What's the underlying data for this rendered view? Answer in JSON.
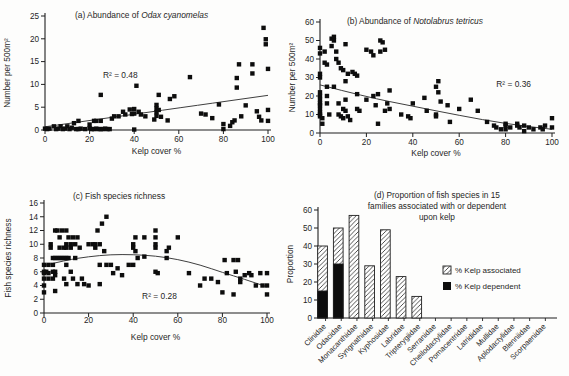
{
  "figure": {
    "background": "#fdfdfc",
    "ink": "#1f1f1f",
    "marker_color": "#0d0d0d",
    "trend_color": "#3f3f3f"
  },
  "chart_data": [
    {
      "id": "a",
      "type": "scatter",
      "title_parts": [
        {
          "t": "(a)  Abundance of ",
          "i": false
        },
        {
          "t": "Odax cyanomelas",
          "i": true
        }
      ],
      "xlabel": "Kelp cover %",
      "ylabel": "Number per 500m²",
      "xlim": [
        0,
        100
      ],
      "ylim": [
        0,
        25
      ],
      "xticks": [
        0,
        20,
        40,
        60,
        80,
        100
      ],
      "yticks": [
        0,
        5,
        10,
        15,
        20,
        25
      ],
      "annotation": {
        "text": "R² = 0.48",
        "x": 26,
        "y": 11.5
      },
      "trend_curve": [
        [
          0,
          0.7
        ],
        [
          50,
          4.15
        ],
        [
          100,
          7.6
        ]
      ],
      "points": [
        [
          0,
          0.3
        ],
        [
          1,
          0.2
        ],
        [
          2,
          0.3
        ],
        [
          4,
          0.8
        ],
        [
          5,
          0.2
        ],
        [
          6,
          0.3
        ],
        [
          7,
          0.8
        ],
        [
          8,
          0.2
        ],
        [
          9,
          0.3
        ],
        [
          10,
          0.8
        ],
        [
          11,
          0.2
        ],
        [
          12,
          0.5
        ],
        [
          13,
          1.5
        ],
        [
          14,
          0.2
        ],
        [
          15,
          2
        ],
        [
          15,
          0.2
        ],
        [
          16,
          0.3
        ],
        [
          18,
          0.2
        ],
        [
          20,
          1.2
        ],
        [
          20,
          0.4
        ],
        [
          21,
          0.2
        ],
        [
          22,
          2
        ],
        [
          22,
          0.2
        ],
        [
          23,
          2
        ],
        [
          23,
          0.3
        ],
        [
          24,
          0.2
        ],
        [
          25,
          7.7
        ],
        [
          25,
          2
        ],
        [
          25,
          0.2
        ],
        [
          26,
          0.2
        ],
        [
          27,
          0.3
        ],
        [
          28,
          0.2
        ],
        [
          29,
          0.2
        ],
        [
          30,
          2.5
        ],
        [
          31,
          3
        ],
        [
          33,
          3
        ],
        [
          35,
          4
        ],
        [
          36,
          3.4
        ],
        [
          38,
          4.5
        ],
        [
          39,
          3.5
        ],
        [
          40,
          4.6
        ],
        [
          40,
          3.6
        ],
        [
          40,
          0.1
        ],
        [
          41,
          9.7
        ],
        [
          42,
          4
        ],
        [
          43,
          3.4
        ],
        [
          45,
          3
        ],
        [
          49,
          2.3
        ],
        [
          50,
          5.5
        ],
        [
          50,
          4.7
        ],
        [
          50,
          3.9
        ],
        [
          50,
          3.1
        ],
        [
          51,
          7.7
        ],
        [
          51,
          4.4
        ],
        [
          52,
          2.9
        ],
        [
          55,
          2.1
        ],
        [
          56,
          6.8
        ],
        [
          58,
          7.4
        ],
        [
          65,
          11.6
        ],
        [
          70,
          3.6
        ],
        [
          72,
          3.4
        ],
        [
          75,
          2.6
        ],
        [
          78,
          5.6
        ],
        [
          80,
          0.2
        ],
        [
          80,
          1.3
        ],
        [
          83,
          0.9
        ],
        [
          84,
          1.7
        ],
        [
          85,
          2.1
        ],
        [
          86,
          11.4
        ],
        [
          86,
          9.3
        ],
        [
          87,
          14.4
        ],
        [
          88,
          3
        ],
        [
          90,
          5.4
        ],
        [
          93,
          14.4
        ],
        [
          93,
          12.4
        ],
        [
          95,
          4.1
        ],
        [
          96,
          2.9
        ],
        [
          97,
          2.1
        ],
        [
          98,
          22.4
        ],
        [
          99,
          19.9
        ],
        [
          99,
          18.8
        ],
        [
          100,
          13.4
        ],
        [
          100,
          4.4
        ],
        [
          100,
          2
        ]
      ]
    },
    {
      "id": "b",
      "type": "scatter",
      "title_parts": [
        {
          "t": "(b)  Abundance of ",
          "i": false
        },
        {
          "t": "Notolabrus tetricus",
          "i": true
        }
      ],
      "xlabel": "Kelp cover %",
      "ylabel": "Number per 500m²",
      "xlim": [
        0,
        100
      ],
      "ylim": [
        0,
        60
      ],
      "xticks": [
        0,
        20,
        40,
        60,
        80,
        100
      ],
      "yticks": [
        0,
        10,
        20,
        30,
        40,
        50,
        60
      ],
      "annotation": {
        "text": "R² = 0.36",
        "x": 76,
        "y": 25
      },
      "trend_curve": [
        [
          0,
          26
        ],
        [
          20,
          19.5
        ],
        [
          40,
          14.5
        ],
        [
          60,
          9.5
        ],
        [
          80,
          5
        ],
        [
          100,
          2
        ]
      ],
      "points": [
        [
          0,
          46
        ],
        [
          0,
          43
        ],
        [
          0,
          32
        ],
        [
          0,
          30
        ],
        [
          0,
          22
        ],
        [
          0,
          20
        ],
        [
          0,
          18
        ],
        [
          0,
          16
        ],
        [
          0,
          15
        ],
        [
          0,
          13
        ],
        [
          0,
          11
        ],
        [
          0,
          10
        ],
        [
          0,
          9
        ],
        [
          1,
          8
        ],
        [
          1,
          5
        ],
        [
          2,
          44
        ],
        [
          2,
          38
        ],
        [
          3,
          37
        ],
        [
          3,
          25
        ],
        [
          3,
          20
        ],
        [
          3,
          16
        ],
        [
          4,
          10
        ],
        [
          5,
          51
        ],
        [
          5,
          47
        ],
        [
          6,
          52
        ],
        [
          6,
          50
        ],
        [
          6,
          25
        ],
        [
          7,
          44
        ],
        [
          7,
          40
        ],
        [
          8,
          38
        ],
        [
          8,
          16
        ],
        [
          8,
          10
        ],
        [
          9,
          35
        ],
        [
          9,
          9
        ],
        [
          10,
          34
        ],
        [
          10,
          13
        ],
        [
          10,
          8
        ],
        [
          11,
          48
        ],
        [
          11,
          28
        ],
        [
          11,
          18
        ],
        [
          11,
          12
        ],
        [
          12,
          32
        ],
        [
          12,
          9
        ],
        [
          13,
          7
        ],
        [
          14,
          33
        ],
        [
          15,
          32
        ],
        [
          16,
          31
        ],
        [
          16,
          21
        ],
        [
          16,
          13
        ],
        [
          17,
          12
        ],
        [
          20,
          45
        ],
        [
          20,
          18
        ],
        [
          22,
          44
        ],
        [
          23,
          42
        ],
        [
          23,
          20
        ],
        [
          24,
          15
        ],
        [
          25,
          21
        ],
        [
          25,
          5
        ],
        [
          26,
          50
        ],
        [
          26,
          44
        ],
        [
          27,
          49
        ],
        [
          28,
          45
        ],
        [
          28,
          12
        ],
        [
          29,
          16
        ],
        [
          30,
          23
        ],
        [
          30,
          13
        ],
        [
          35,
          10
        ],
        [
          38,
          9
        ],
        [
          39,
          8
        ],
        [
          40,
          16
        ],
        [
          45,
          19
        ],
        [
          46,
          12
        ],
        [
          50,
          25
        ],
        [
          50,
          10
        ],
        [
          50,
          9
        ],
        [
          51,
          28
        ],
        [
          51,
          22
        ],
        [
          52,
          17
        ],
        [
          55,
          15
        ],
        [
          56,
          6
        ],
        [
          60,
          13
        ],
        [
          65,
          18
        ],
        [
          68,
          12
        ],
        [
          72,
          6
        ],
        [
          75,
          4
        ],
        [
          76,
          3
        ],
        [
          78,
          2
        ],
        [
          80,
          5
        ],
        [
          80,
          4
        ],
        [
          80,
          2
        ],
        [
          82,
          3
        ],
        [
          85,
          5
        ],
        [
          85,
          4
        ],
        [
          86,
          3
        ],
        [
          88,
          4
        ],
        [
          88,
          1
        ],
        [
          90,
          3
        ],
        [
          92,
          2
        ],
        [
          95,
          3
        ],
        [
          96,
          2
        ],
        [
          97,
          4
        ],
        [
          100,
          8
        ],
        [
          100,
          3
        ]
      ]
    },
    {
      "id": "c",
      "type": "scatter",
      "title_parts": [
        {
          "t": "(c)  Fish species richness",
          "i": false
        }
      ],
      "xlabel": "Kelp cover %",
      "ylabel": "Fish species richness",
      "xlim": [
        0,
        100
      ],
      "ylim": [
        0,
        16
      ],
      "xticks": [
        0,
        20,
        40,
        60,
        80,
        100
      ],
      "yticks": [
        0,
        2,
        4,
        6,
        8,
        10,
        12,
        14,
        16
      ],
      "annotation": {
        "text": "R² = 0.28",
        "x": 44,
        "y": 2.1
      },
      "trend_curve": [
        [
          0,
          6.9
        ],
        [
          10,
          7.7
        ],
        [
          20,
          8.2
        ],
        [
          30,
          8.5
        ],
        [
          40,
          8.5
        ],
        [
          50,
          8.3
        ],
        [
          60,
          7.8
        ],
        [
          70,
          7.0
        ],
        [
          80,
          5.9
        ],
        [
          90,
          4.9
        ],
        [
          100,
          3.8
        ]
      ],
      "points": [
        [
          0,
          7
        ],
        [
          0,
          6
        ],
        [
          0,
          5.8
        ],
        [
          0,
          5
        ],
        [
          0,
          4
        ],
        [
          0,
          3
        ],
        [
          1,
          6
        ],
        [
          2,
          7
        ],
        [
          2,
          5.8
        ],
        [
          2,
          5
        ],
        [
          3,
          10
        ],
        [
          3,
          9.5
        ],
        [
          4,
          8
        ],
        [
          4,
          7
        ],
        [
          4,
          6
        ],
        [
          4,
          5
        ],
        [
          5,
          12
        ],
        [
          5,
          8
        ],
        [
          5,
          6
        ],
        [
          5,
          5.5
        ],
        [
          5,
          3.2
        ],
        [
          6,
          12
        ],
        [
          6,
          8
        ],
        [
          7,
          11
        ],
        [
          7,
          9.5
        ],
        [
          7,
          8
        ],
        [
          8,
          12
        ],
        [
          8,
          8
        ],
        [
          9,
          9.5
        ],
        [
          9,
          8
        ],
        [
          9,
          5
        ],
        [
          10,
          12
        ],
        [
          10,
          10
        ],
        [
          10,
          9.5
        ],
        [
          10,
          8
        ],
        [
          10,
          7
        ],
        [
          10,
          4.2
        ],
        [
          11,
          11
        ],
        [
          11,
          8
        ],
        [
          12,
          10
        ],
        [
          12,
          9.5
        ],
        [
          12,
          6
        ],
        [
          13,
          11
        ],
        [
          13,
          5
        ],
        [
          14,
          10
        ],
        [
          14,
          8
        ],
        [
          15,
          11
        ],
        [
          15,
          4.2
        ],
        [
          16,
          9.5
        ],
        [
          17,
          5
        ],
        [
          18,
          4.2
        ],
        [
          20,
          10
        ],
        [
          20,
          4
        ],
        [
          22,
          10
        ],
        [
          23,
          10
        ],
        [
          23,
          9.5
        ],
        [
          24,
          12
        ],
        [
          25,
          10
        ],
        [
          25,
          7
        ],
        [
          25,
          4.2
        ],
        [
          26,
          13
        ],
        [
          27,
          9
        ],
        [
          28,
          14
        ],
        [
          28,
          7
        ],
        [
          30,
          7
        ],
        [
          31,
          5.8
        ],
        [
          33,
          6.5
        ],
        [
          35,
          5.5
        ],
        [
          38,
          7
        ],
        [
          40,
          10
        ],
        [
          40,
          9.5
        ],
        [
          40,
          7
        ],
        [
          41,
          11
        ],
        [
          41,
          9
        ],
        [
          42,
          8
        ],
        [
          45,
          11
        ],
        [
          45,
          8.2
        ],
        [
          50,
          12
        ],
        [
          50,
          11
        ],
        [
          50,
          10
        ],
        [
          50,
          9.5
        ],
        [
          50,
          6
        ],
        [
          51,
          5.8
        ],
        [
          55,
          9
        ],
        [
          55,
          8
        ],
        [
          56,
          9.5
        ],
        [
          60,
          11
        ],
        [
          65,
          5.8
        ],
        [
          70,
          4
        ],
        [
          72,
          5
        ],
        [
          75,
          5
        ],
        [
          78,
          4.5
        ],
        [
          80,
          3
        ],
        [
          81,
          7.7
        ],
        [
          82,
          5.8
        ],
        [
          85,
          7.7
        ],
        [
          85,
          2.7
        ],
        [
          86,
          6
        ],
        [
          87,
          7.7
        ],
        [
          88,
          5
        ],
        [
          88,
          4.5
        ],
        [
          90,
          5.5
        ],
        [
          92,
          5.8
        ],
        [
          93,
          5.5
        ],
        [
          95,
          4
        ],
        [
          97,
          5.8
        ],
        [
          98,
          4
        ],
        [
          100,
          5.8
        ],
        [
          100,
          4
        ],
        [
          100,
          2.7
        ]
      ]
    },
    {
      "id": "d",
      "type": "bar",
      "title_lines": [
        "(d) Proportion of fish species in 15",
        "families associated with or dependent",
        "upon kelp"
      ],
      "ylabel": "Proportion",
      "ylim": [
        0,
        60
      ],
      "yticks": [
        0,
        10,
        20,
        30,
        40,
        50,
        60
      ],
      "categories": [
        "Clinidae",
        "Odacidae",
        "Monacanthidae",
        "Syngnathidae",
        "Kyphosidae",
        "Labridae",
        "Tripterygiidae",
        "Serranidae",
        "Cheilodactylidae",
        "Pomacentridae",
        "Latrididae",
        "Mullidae",
        "Aplodactylidae",
        "Blenniidae",
        "Scorpaenidae"
      ],
      "series": [
        {
          "name": "% Kelp associated",
          "style": "hatched",
          "values": [
            40,
            50,
            57,
            29,
            49,
            23,
            12,
            0,
            0,
            0,
            0,
            0,
            0,
            0,
            0
          ]
        },
        {
          "name": "% Kelp dependent",
          "style": "solid",
          "values": [
            15,
            30,
            0,
            0,
            0,
            0,
            0,
            0,
            0,
            0,
            0,
            0,
            0,
            0,
            0
          ]
        }
      ],
      "legend_position": "middle-right"
    }
  ]
}
